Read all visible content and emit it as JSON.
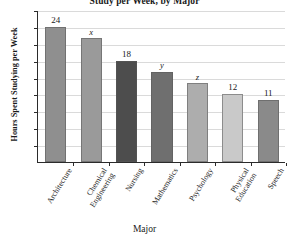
{
  "chart_data": {
    "type": "bar",
    "title": "Study per Week, by Major",
    "xlabel": "Major",
    "ylabel": "Hours Spent Studying per Week",
    "categories": [
      "Architecture",
      "Chemical Engineering",
      "Nursing",
      "Mathematics",
      "Psychology",
      "Physical Education",
      "Speech"
    ],
    "category_lines": [
      [
        "Architecture"
      ],
      [
        "Chemical",
        "Engineering"
      ],
      [
        "Nursing"
      ],
      [
        "Mathematics"
      ],
      [
        "Psychology"
      ],
      [
        "Physical",
        "Education"
      ],
      [
        "Speech"
      ]
    ],
    "values": [
      24,
      22,
      18,
      16,
      14,
      12,
      11
    ],
    "bar_labels": [
      "24",
      "x",
      "18",
      "y",
      "z",
      "12",
      "11"
    ],
    "bar_label_is_variable": [
      false,
      true,
      false,
      true,
      true,
      false,
      false
    ],
    "bar_colors": [
      "#8f8f8f",
      "#9a9a9a",
      "#4d4d4d",
      "#6f6f6f",
      "#adadad",
      "#c9c9c9",
      "#8a8a8a"
    ],
    "ylim": [
      0,
      27
    ],
    "yticks": [
      3,
      6,
      9,
      12,
      15,
      18,
      21,
      24,
      27
    ],
    "ytick_labels": [
      "3",
      "6",
      "9",
      "12",
      "15",
      "18",
      "21",
      "24",
      "27"
    ],
    "grid": true,
    "legend": "none"
  }
}
